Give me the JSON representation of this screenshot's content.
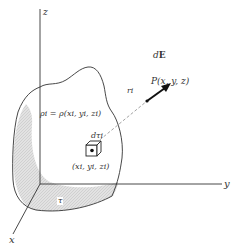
{
  "diagram": {
    "axes": {
      "x_label": "x",
      "y_label": "y",
      "z_label": "z"
    },
    "labels": {
      "charge_density": "ρi = ρ(xi, yi, zi)",
      "volume_element": "dτi",
      "source_point": "(xi, yi, zi)",
      "volume_region": "τ",
      "separation": "ri",
      "field_point": "P(x, y, z)",
      "field_element_prefix": "d",
      "field_element_vector": "E"
    },
    "colors": {
      "line": "#333333",
      "shading": "#d8d8d8",
      "dashed": "#999999",
      "arrow": "#111111"
    }
  }
}
